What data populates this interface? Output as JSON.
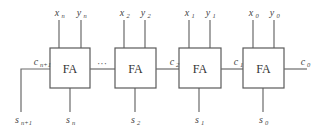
{
  "diagram": {
    "block_label": "FA",
    "ellipsis": "···",
    "blocks": [
      {
        "id": "n",
        "label": "FA",
        "inputs": [
          {
            "var": "x",
            "sub": "n"
          },
          {
            "var": "y",
            "sub": "n"
          }
        ],
        "sum": {
          "var": "s",
          "sub": "n"
        },
        "carry_in_label": null,
        "carry_out_label": {
          "var": "c",
          "sub": "n+1"
        }
      },
      {
        "id": "2",
        "label": "FA",
        "inputs": [
          {
            "var": "x",
            "sub": "2"
          },
          {
            "var": "y",
            "sub": "2"
          }
        ],
        "sum": {
          "var": "s",
          "sub": "2"
        },
        "carry_in_label": {
          "var": "c",
          "sub": "2"
        }
      },
      {
        "id": "1",
        "label": "FA",
        "inputs": [
          {
            "var": "x",
            "sub": "1"
          },
          {
            "var": "y",
            "sub": "1"
          }
        ],
        "sum": {
          "var": "s",
          "sub": "1"
        },
        "carry_in_label": {
          "var": "c",
          "sub": "1"
        }
      },
      {
        "id": "0",
        "label": "FA",
        "inputs": [
          {
            "var": "x",
            "sub": "0"
          },
          {
            "var": "y",
            "sub": "0"
          }
        ],
        "sum": {
          "var": "s",
          "sub": "0"
        },
        "carry_in_label": {
          "var": "c",
          "sub": "0"
        }
      }
    ],
    "labels": {
      "xn": {
        "v": "x",
        "s": "n"
      },
      "yn": {
        "v": "y",
        "s": "n"
      },
      "x2": {
        "v": "x",
        "s": "2"
      },
      "y2": {
        "v": "y",
        "s": "2"
      },
      "x1": {
        "v": "x",
        "s": "1"
      },
      "y1": {
        "v": "y",
        "s": "1"
      },
      "x0": {
        "v": "x",
        "s": "0"
      },
      "y0": {
        "v": "y",
        "s": "0"
      },
      "sn": {
        "v": "s",
        "s": "n"
      },
      "s2": {
        "v": "s",
        "s": "2"
      },
      "s1": {
        "v": "s",
        "s": "1"
      },
      "s0": {
        "v": "s",
        "s": "0"
      },
      "snp1": {
        "v": "s",
        "s": "n+1"
      },
      "cnp1": {
        "v": "c",
        "s": "n+1"
      },
      "c2": {
        "v": "c",
        "s": "2"
      },
      "c1": {
        "v": "c",
        "s": "1"
      },
      "c0": {
        "v": "c",
        "s": "0"
      }
    },
    "colors": {
      "line": "#6a6a6a",
      "text": "#444444",
      "background": "#ffffff"
    }
  }
}
